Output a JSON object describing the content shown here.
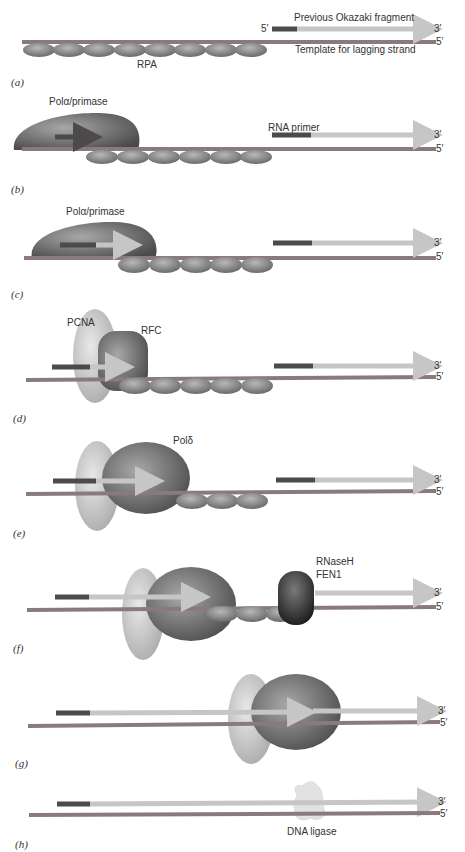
{
  "figure": {
    "end_labels": {
      "three_prime": "3′",
      "five_prime": "5′"
    },
    "colors": {
      "template_strand": "#8a7a7c",
      "rna_primer": "#4d4a4c",
      "new_dna": "#c6c6c6",
      "rpa": "#8c8c8c",
      "pcna": "#cfcfcf",
      "polymerase": "#6e6e6e",
      "rnaseh_fen1": "#2e2e2e",
      "ligase": "#e2e2e2"
    },
    "panels": [
      {
        "id": "a",
        "label": "(a)",
        "annotations": {
          "top": "Previous Okazaki fragment",
          "five": "5′",
          "template": "Template for lagging strand",
          "rpa": "RPA"
        }
      },
      {
        "id": "b",
        "label": "(b)",
        "annotations": {
          "enzyme": "Polα/primase",
          "primer": "RNA primer"
        }
      },
      {
        "id": "c",
        "label": "(c)",
        "annotations": {
          "enzyme": "Polα/primase"
        }
      },
      {
        "id": "d",
        "label": "(d)",
        "annotations": {
          "clamp": "PCNA",
          "loader": "RFC"
        }
      },
      {
        "id": "e",
        "label": "(e)",
        "annotations": {
          "polymerase": "Polδ"
        }
      },
      {
        "id": "f",
        "label": "(f)",
        "annotations": {
          "nuclease1": "RNaseH",
          "nuclease2": "FEN1"
        }
      },
      {
        "id": "g",
        "label": "(g)",
        "annotations": {}
      },
      {
        "id": "h",
        "label": "(h)",
        "annotations": {
          "ligase": "DNA ligase"
        }
      }
    ]
  }
}
